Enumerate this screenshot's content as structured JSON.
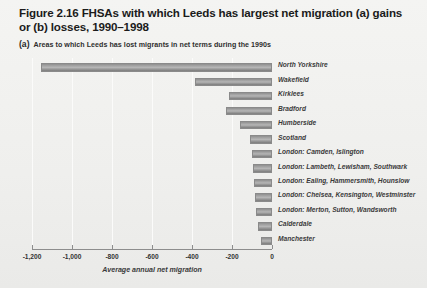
{
  "figure": {
    "title": "Figure 2.16  FHSAs with which Leeds has largest net migration (a) gains or (b) losses, 1990–1998",
    "panel_tag": "(a)",
    "panel_caption": "Areas to which Leeds has lost migrants in net terms during the 1990s",
    "background_color": "#f0f0ee",
    "bar_color": "#9a9a9a"
  },
  "chart_data": {
    "type": "bar",
    "orientation": "horizontal",
    "title": "Figure 2.16  FHSAs with which Leeds has largest net migration (a) gains or (b) losses, 1990–1998",
    "subtitle": "(a) Areas to which Leeds has lost migrants in net terms during the 1990s",
    "xlabel": "Average annual net migration",
    "ylabel": "",
    "xlim": [
      -1200,
      0
    ],
    "xticks": [
      -1200,
      -1000,
      -800,
      -600,
      -400,
      -200,
      0
    ],
    "xticklabels": [
      "-1,200",
      "-1,000",
      "-800",
      "-600",
      "-400",
      "-200",
      "0"
    ],
    "grid": true,
    "legend": false,
    "categories": [
      "North Yorkshire",
      "Wakefield",
      "Kirklees",
      "Bradford",
      "Humberside",
      "Scotland",
      "London: Camden, Islington",
      "London: Lambeth, Lewisham, Southwark",
      "London: Ealing, Hammersmith, Hounslow",
      "London: Chelsea, Kensington, Westminster",
      "London: Merton, Sutton, Wandsworth",
      "Calderdale",
      "Manchester"
    ],
    "values": [
      -1155,
      -385,
      -215,
      -230,
      -160,
      -110,
      -100,
      -95,
      -90,
      -85,
      -80,
      -70,
      -55
    ]
  }
}
